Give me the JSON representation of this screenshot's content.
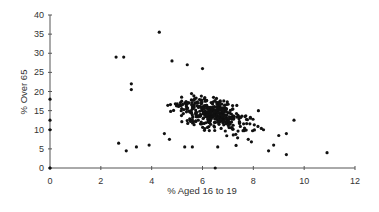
{
  "chart_data": {
    "type": "scatter",
    "title": "",
    "xlabel": "% Aged 16 to 19",
    "ylabel": "% Over 65",
    "xlim": [
      0,
      12
    ],
    "ylim": [
      0,
      40
    ],
    "xticks": [
      0,
      2,
      4,
      6,
      8,
      10,
      12
    ],
    "yticks": [
      0,
      5,
      10,
      15,
      20,
      25,
      30,
      35,
      40
    ],
    "grid": false,
    "legend": null,
    "series": [
      {
        "name": "areas",
        "points": [
          [
            0,
            0
          ],
          [
            0,
            10
          ],
          [
            0,
            12.5
          ],
          [
            0,
            18
          ],
          [
            6.5,
            0
          ],
          [
            2.6,
            29
          ],
          [
            2.9,
            29
          ],
          [
            4.3,
            35.5
          ],
          [
            4.8,
            28
          ],
          [
            5.4,
            27
          ],
          [
            6.0,
            26
          ],
          [
            3.2,
            22
          ],
          [
            3.2,
            20.5
          ],
          [
            2.7,
            6.5
          ],
          [
            3.0,
            4.5
          ],
          [
            3.4,
            5.5
          ],
          [
            3.9,
            6
          ],
          [
            4.5,
            9
          ],
          [
            4.7,
            7.5
          ],
          [
            5.3,
            5.5
          ],
          [
            5.6,
            5.5
          ],
          [
            6.6,
            5.5
          ],
          [
            8.6,
            4.5
          ],
          [
            9.3,
            3.5
          ],
          [
            9.6,
            12.5
          ],
          [
            9.3,
            9
          ],
          [
            10.9,
            4
          ],
          [
            8.2,
            15
          ],
          [
            8.8,
            6
          ],
          [
            9.0,
            8.5
          ],
          [
            8.4,
            10
          ],
          [
            7.8,
            7.5
          ]
        ],
        "cluster": {
          "center_x": 6.4,
          "center_y": 14,
          "n_approx": 400,
          "trend": "negative"
        }
      }
    ]
  }
}
